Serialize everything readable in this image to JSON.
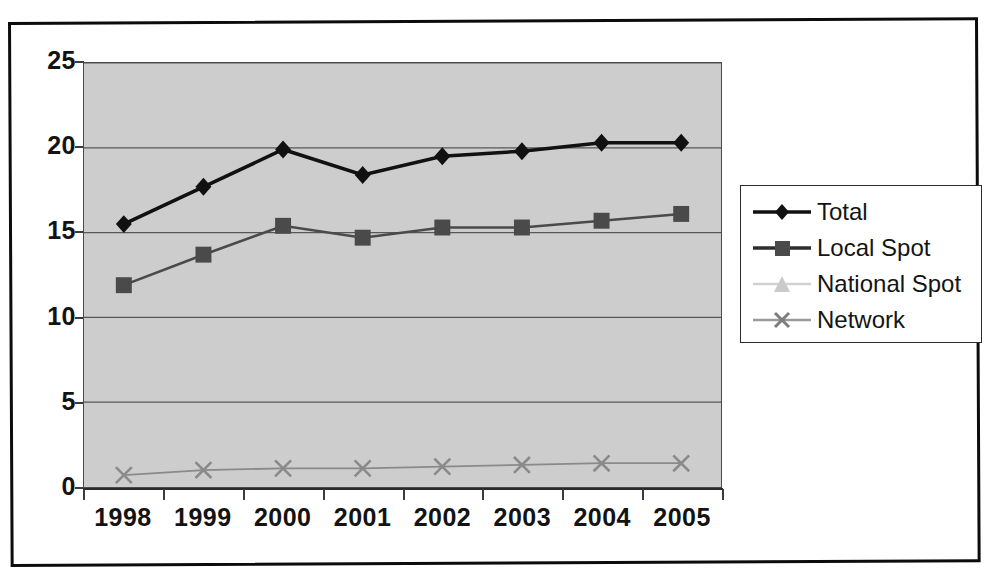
{
  "chart_data": {
    "type": "line",
    "title": "",
    "subtitle": "",
    "xlabel": "",
    "ylabel": "",
    "categories": [
      "1998",
      "1999",
      "2000",
      "2001",
      "2002",
      "2003",
      "2004",
      "2005"
    ],
    "ylim": [
      0,
      25
    ],
    "yticks": [
      "0",
      "5",
      "10",
      "15",
      "20",
      "25"
    ],
    "ytick_values": [
      0,
      5,
      10,
      15,
      20,
      25
    ],
    "grid": true,
    "grid_axis": "y",
    "legend_position": "right",
    "plot_background": "#cdcdcd",
    "series": [
      {
        "name": "Total",
        "marker": "diamond",
        "color": "#111111",
        "values": [
          15.5,
          17.7,
          19.9,
          18.4,
          19.5,
          19.8,
          20.3,
          20.3
        ]
      },
      {
        "name": "Local Spot",
        "marker": "square",
        "color": "#4a4a4a",
        "values": [
          11.9,
          13.7,
          15.4,
          14.7,
          15.3,
          15.3,
          15.7,
          16.1
        ]
      },
      {
        "name": "National Spot",
        "marker": "triangle",
        "color": "#c4c4c4",
        "values": [
          null,
          null,
          null,
          null,
          null,
          null,
          null,
          null
        ]
      },
      {
        "name": "Network",
        "marker": "x",
        "color": "#8a8a8a",
        "values": [
          0.7,
          1.0,
          1.1,
          1.1,
          1.2,
          1.3,
          1.4,
          1.4
        ]
      }
    ]
  },
  "legend": {
    "items": [
      {
        "label": "Total",
        "marker": "diamond",
        "color": "#111111"
      },
      {
        "label": "Local Spot",
        "marker": "square",
        "color": "#4a4a4a"
      },
      {
        "label": "National Spot",
        "marker": "triangle",
        "color": "#c9c9c9"
      },
      {
        "label": "Network",
        "marker": "x",
        "color": "#8f8f8f"
      }
    ]
  },
  "axis": {
    "y_labels": [
      "25",
      "20",
      "15",
      "10",
      "5",
      "0"
    ],
    "x_labels": [
      "1998",
      "1999",
      "2000",
      "2001",
      "2002",
      "2003",
      "2004",
      "2005"
    ]
  }
}
